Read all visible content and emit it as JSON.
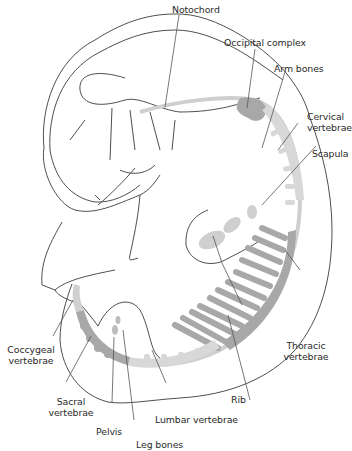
{
  "diagram": {
    "labels": {
      "notochord": "Notochord",
      "occipital_complex": "Occipital complex",
      "arm_bones": "Arm bones",
      "cervical_vertebrae": "Cervical\nvertebrae",
      "scapula": "Scapula",
      "thoracic_vertebrae": "Thoracic\nvertebrae",
      "rib": "Rib",
      "lumbar_vertebrae": "Lumbar vertebrae",
      "leg_bones": "Leg bones",
      "pelvis": "Pelvis",
      "sacral_vertebrae": "Sacral\nvertebrae",
      "coccygeal_vertebrae": "Coccygeal\nvertebrae"
    },
    "colors": {
      "outline": "#3a3a3a",
      "light_bone": "#d6d6d6",
      "dark_bone": "#a8a8a8",
      "leader_line": "#555555",
      "text": "#2a2a2a"
    }
  }
}
